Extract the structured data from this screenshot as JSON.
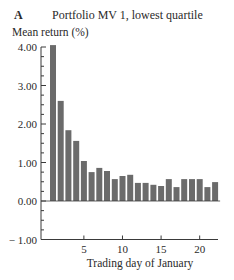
{
  "panel": {
    "letter": "A",
    "title": "Portfolio MV 1, lowest quartile"
  },
  "chart_data": {
    "type": "bar",
    "title": "Portfolio MV 1, lowest quartile",
    "panel_label": "A",
    "xlabel": "Trading day of January",
    "ylabel": "Mean return (%)",
    "ylim": [
      -1.0,
      4.0
    ],
    "xlim": [
      0.5,
      22.5
    ],
    "yticks": [
      "4.00",
      "3.00",
      "2.00",
      "1.00",
      "0.00",
      "− 1.00"
    ],
    "ytick_values": [
      4.0,
      3.0,
      2.0,
      1.0,
      0.0,
      -1.0
    ],
    "y_minor_step": 0.25,
    "xticks": [
      "5",
      "10",
      "15",
      "20"
    ],
    "xtick_values": [
      5,
      10,
      15,
      20
    ],
    "grid": false,
    "legend": null,
    "bar_color": "#6b6b6b",
    "categories": [
      1,
      2,
      3,
      4,
      5,
      6,
      7,
      8,
      9,
      10,
      11,
      12,
      13,
      14,
      15,
      16,
      17,
      18,
      19,
      20,
      21,
      22
    ],
    "values": [
      4.05,
      2.6,
      1.84,
      1.56,
      1.04,
      0.75,
      0.86,
      0.78,
      0.57,
      0.65,
      0.68,
      0.47,
      0.47,
      0.42,
      0.39,
      0.57,
      0.36,
      0.57,
      0.57,
      0.57,
      0.36,
      0.49
    ]
  }
}
